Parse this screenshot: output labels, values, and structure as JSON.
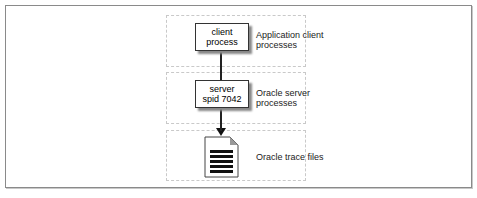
{
  "diagram": {
    "tiers": [
      {
        "box": [
          "client",
          "process"
        ],
        "label": [
          "Application client",
          "processes"
        ]
      },
      {
        "box": [
          "server",
          "spid 7042"
        ],
        "label": [
          "Oracle server",
          "processes"
        ]
      },
      {
        "box": null,
        "label": [
          "Oracle trace files"
        ]
      }
    ],
    "icons": {
      "trace_file": "document-icon"
    },
    "colors": {
      "border": "#8a8a8a",
      "dashed": "#c9c9c9",
      "ink": "#222222"
    }
  }
}
